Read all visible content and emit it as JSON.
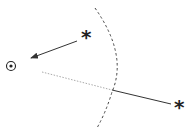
{
  "diagram": {
    "nodes": [
      {
        "id": "observer",
        "symbol": "⊙",
        "x": 11,
        "y": 66
      },
      {
        "id": "near-star",
        "symbol": "*",
        "x": 88,
        "y": 37
      },
      {
        "id": "far-star",
        "symbol": "*",
        "x": 181,
        "y": 107
      }
    ],
    "edges": [
      {
        "from": "near-star",
        "to": "observer",
        "style": "solid-arrow"
      },
      {
        "from": "far-star",
        "to": "observer",
        "style": "solid-then-dotted",
        "fades_at": "boundary"
      }
    ],
    "boundary": {
      "style": "dashed-arc"
    },
    "colors": {
      "line": "#333333",
      "dotted": "#999999"
    }
  }
}
